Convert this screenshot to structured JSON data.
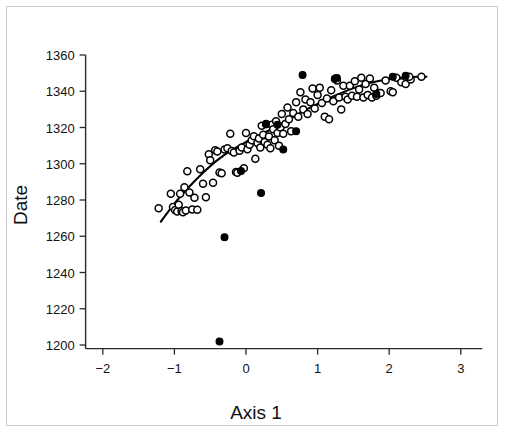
{
  "figure": {
    "background_color": "#ffffff",
    "border_color": "#c9c9c9",
    "marker_open_label": "open-circle",
    "marker_filled_label": "filled-circle"
  },
  "chart_data": {
    "type": "scatter",
    "title": "",
    "xlabel": "Axis  1",
    "ylabel": "Date",
    "xlim": [
      -2.45,
      3.3
    ],
    "ylim": [
      1195,
      1364
    ],
    "xticks": [
      -2,
      -1,
      0,
      1,
      2,
      3
    ],
    "xticklabels": [
      "−2",
      "−1",
      "0",
      "1",
      "2",
      "3"
    ],
    "yticks": [
      1200,
      1220,
      1240,
      1260,
      1280,
      1300,
      1320,
      1340,
      1360
    ],
    "yticklabels": [
      "1200",
      "1220",
      "1240",
      "1260",
      "1280",
      "1300",
      "1320",
      "1340",
      "1360"
    ],
    "grid": false,
    "legend": null,
    "series": [
      {
        "name": "open-circle samples",
        "marker": "open-circle",
        "color": "#000000",
        "points": [
          [
            -1.22,
            1275.5
          ],
          [
            -1.05,
            1283.5
          ],
          [
            -1.02,
            1276.2
          ],
          [
            -0.99,
            1274.5
          ],
          [
            -0.96,
            1273.6
          ],
          [
            -0.94,
            1277.4
          ],
          [
            -0.92,
            1283.4
          ],
          [
            -0.9,
            1274.0
          ],
          [
            -0.88,
            1273.3
          ],
          [
            -0.86,
            1287.0
          ],
          [
            -0.84,
            1274.2
          ],
          [
            -0.82,
            1295.9
          ],
          [
            -0.79,
            1284.2
          ],
          [
            -0.75,
            1274.8
          ],
          [
            -0.72,
            1281.3
          ],
          [
            -0.68,
            1274.6
          ],
          [
            -0.64,
            1297.0
          ],
          [
            -0.6,
            1289.0
          ],
          [
            -0.56,
            1281.5
          ],
          [
            -0.52,
            1305.3
          ],
          [
            -0.5,
            1302.0
          ],
          [
            -0.46,
            1289.5
          ],
          [
            -0.43,
            1307.5
          ],
          [
            -0.4,
            1306.8
          ],
          [
            -0.37,
            1295.2
          ],
          [
            -0.34,
            1294.8
          ],
          [
            -0.3,
            1307.9
          ],
          [
            -0.26,
            1308.5
          ],
          [
            -0.22,
            1316.5
          ],
          [
            -0.2,
            1307.0
          ],
          [
            -0.17,
            1306.2
          ],
          [
            -0.14,
            1295.5
          ],
          [
            -0.12,
            1295.0
          ],
          [
            -0.09,
            1307.2
          ],
          [
            -0.06,
            1309.0
          ],
          [
            -0.03,
            1297.5
          ],
          [
            0.0,
            1317.0
          ],
          [
            0.02,
            1308.0
          ],
          [
            0.05,
            1310.5
          ],
          [
            0.08,
            1313.0
          ],
          [
            0.11,
            1315.2
          ],
          [
            0.13,
            1302.8
          ],
          [
            0.16,
            1311.5
          ],
          [
            0.18,
            1314.0
          ],
          [
            0.2,
            1309.0
          ],
          [
            0.22,
            1321.0
          ],
          [
            0.24,
            1316.0
          ],
          [
            0.26,
            1312.0
          ],
          [
            0.28,
            1322.0
          ],
          [
            0.3,
            1310.5
          ],
          [
            0.32,
            1315.0
          ],
          [
            0.34,
            1308.5
          ],
          [
            0.36,
            1321.5
          ],
          [
            0.38,
            1319.0
          ],
          [
            0.4,
            1313.0
          ],
          [
            0.42,
            1323.5
          ],
          [
            0.44,
            1317.0
          ],
          [
            0.46,
            1310.0
          ],
          [
            0.48,
            1320.0
          ],
          [
            0.5,
            1327.5
          ],
          [
            0.52,
            1316.5
          ],
          [
            0.55,
            1322.0
          ],
          [
            0.58,
            1331.0
          ],
          [
            0.6,
            1324.5
          ],
          [
            0.63,
            1318.0
          ],
          [
            0.66,
            1328.0
          ],
          [
            0.7,
            1334.0
          ],
          [
            0.73,
            1326.0
          ],
          [
            0.76,
            1339.5
          ],
          [
            0.8,
            1330.0
          ],
          [
            0.83,
            1335.5
          ],
          [
            0.86,
            1327.5
          ],
          [
            0.9,
            1334.0
          ],
          [
            0.93,
            1341.5
          ],
          [
            0.96,
            1330.5
          ],
          [
            1.0,
            1338.0
          ],
          [
            1.03,
            1342.0
          ],
          [
            1.06,
            1333.5
          ],
          [
            1.1,
            1326.0
          ],
          [
            1.13,
            1336.0
          ],
          [
            1.16,
            1324.5
          ],
          [
            1.19,
            1340.5
          ],
          [
            1.22,
            1334.5
          ],
          [
            1.25,
            1347.0
          ],
          [
            1.27,
            1346.0
          ],
          [
            1.3,
            1336.5
          ],
          [
            1.33,
            1330.0
          ],
          [
            1.36,
            1343.0
          ],
          [
            1.39,
            1337.0
          ],
          [
            1.42,
            1335.5
          ],
          [
            1.45,
            1343.0
          ],
          [
            1.48,
            1337.5
          ],
          [
            1.52,
            1345.5
          ],
          [
            1.55,
            1337.0
          ],
          [
            1.58,
            1341.0
          ],
          [
            1.61,
            1347.5
          ],
          [
            1.64,
            1336.5
          ],
          [
            1.67,
            1344.0
          ],
          [
            1.7,
            1338.0
          ],
          [
            1.73,
            1347.0
          ],
          [
            1.76,
            1336.5
          ],
          [
            1.79,
            1342.0
          ],
          [
            1.82,
            1337.5
          ],
          [
            1.85,
            1339.0
          ],
          [
            1.88,
            1339.0
          ],
          [
            1.95,
            1346.0
          ],
          [
            2.02,
            1340.0
          ],
          [
            2.05,
            1339.5
          ],
          [
            2.1,
            1347.5
          ],
          [
            2.17,
            1345.0
          ],
          [
            2.23,
            1344.0
          ],
          [
            2.3,
            1346.5
          ],
          [
            2.45,
            1348.0
          ],
          [
            2.28,
            1348.0
          ]
        ]
      },
      {
        "name": "filled-circle samples",
        "marker": "filled-circle",
        "color": "#000000",
        "points": [
          [
            -0.37,
            1202.0
          ],
          [
            -0.3,
            1259.5
          ],
          [
            0.21,
            1283.8
          ],
          [
            0.52,
            1307.8
          ],
          [
            0.28,
            1321.8
          ],
          [
            0.7,
            1318.0
          ],
          [
            0.79,
            1349.0
          ],
          [
            1.24,
            1346.8
          ],
          [
            1.27,
            1347.3
          ],
          [
            1.82,
            1338.5
          ],
          [
            2.05,
            1348.0
          ],
          [
            2.23,
            1348.5
          ],
          [
            0.44,
            1321.5
          ],
          [
            -0.07,
            1296.0
          ]
        ]
      }
    ],
    "fit_curve": {
      "name": "fitted-curve",
      "color": "#000000",
      "points": [
        [
          -1.19,
          1268.0
        ],
        [
          -1.0,
          1278.0
        ],
        [
          -0.8,
          1287.0
        ],
        [
          -0.6,
          1295.0
        ],
        [
          -0.4,
          1302.0
        ],
        [
          -0.2,
          1307.5
        ],
        [
          0.0,
          1312.0
        ],
        [
          0.2,
          1316.0
        ],
        [
          0.4,
          1320.0
        ],
        [
          0.6,
          1324.5
        ],
        [
          0.8,
          1329.0
        ],
        [
          1.0,
          1333.0
        ],
        [
          1.2,
          1336.8
        ],
        [
          1.4,
          1340.2
        ],
        [
          1.6,
          1343.0
        ],
        [
          1.8,
          1345.2
        ],
        [
          2.0,
          1346.8
        ],
        [
          2.2,
          1347.6
        ],
        [
          2.4,
          1348.0
        ],
        [
          2.52,
          1348.0
        ]
      ]
    }
  }
}
